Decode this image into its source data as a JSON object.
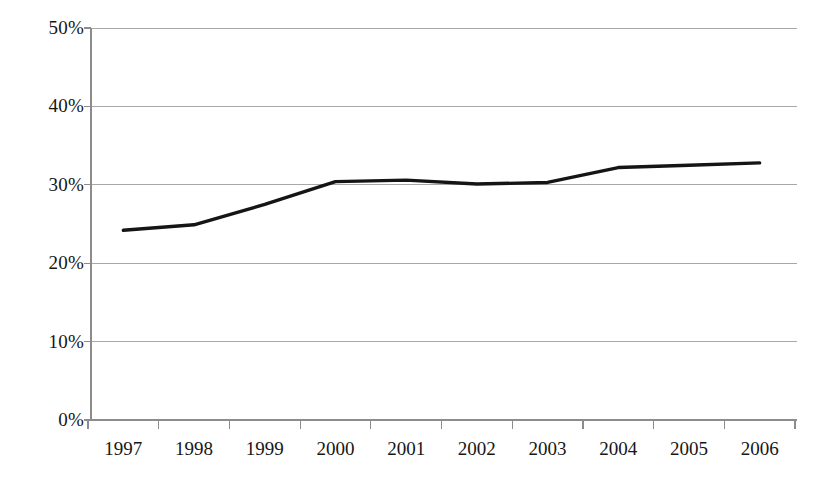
{
  "chart_data": {
    "type": "line",
    "title": "",
    "subtitle": "",
    "xlabel": "",
    "ylabel": "",
    "categories": [
      "1997",
      "1998",
      "1999",
      "2000",
      "2001",
      "2002",
      "2003",
      "2004",
      "2005",
      "2006"
    ],
    "values": [
      24.2,
      24.9,
      27.5,
      30.4,
      30.6,
      30.1,
      30.3,
      32.2,
      32.5,
      32.8
    ],
    "series": [
      {
        "name": "",
        "values": [
          24.2,
          24.9,
          27.5,
          30.4,
          30.6,
          30.1,
          30.3,
          32.2,
          32.5,
          32.8
        ]
      }
    ],
    "ylim": [
      0,
      50
    ],
    "y_ticks": [
      0,
      10,
      20,
      30,
      40,
      50
    ],
    "y_tick_labels": [
      "0%",
      "10%",
      "20%",
      "30%",
      "40%",
      "50%"
    ],
    "x_tick_labels": [
      "1997",
      "1998",
      "1999",
      "2000",
      "2001",
      "2002",
      "2003",
      "2004",
      "2005",
      "2006"
    ],
    "value_format": "percent",
    "grid": true,
    "grid_axis": "y",
    "legend": false,
    "legend_position": "none",
    "line_color": "#151515",
    "gridline_color": "#a8a8a8",
    "axis_color": "#8c8c8c",
    "background_color": "#ffffff",
    "annotations": []
  },
  "axes": {
    "y": {
      "ticks": [
        {
          "label": "50%",
          "value": 50
        },
        {
          "label": "40%",
          "value": 40
        },
        {
          "label": "30%",
          "value": 30
        },
        {
          "label": "20%",
          "value": 20
        },
        {
          "label": "10%",
          "value": 10
        },
        {
          "label": "0%",
          "value": 0
        }
      ]
    },
    "x": {
      "ticks": [
        {
          "label": "1997"
        },
        {
          "label": "1998"
        },
        {
          "label": "1999"
        },
        {
          "label": "2000"
        },
        {
          "label": "2001"
        },
        {
          "label": "2002"
        },
        {
          "label": "2003"
        },
        {
          "label": "2004"
        },
        {
          "label": "2005"
        },
        {
          "label": "2006"
        }
      ]
    }
  }
}
